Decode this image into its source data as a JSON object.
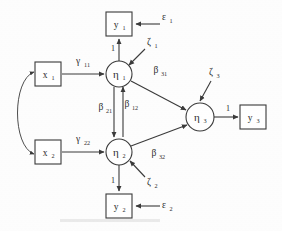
{
  "diagram": {
    "type": "path-diagram",
    "colors": {
      "stroke": "#3a3a3a",
      "text": "#2b2b2b",
      "background": "#fdfdfd"
    },
    "observed_variables": [
      {
        "id": "y1",
        "base": "y",
        "sub": "1",
        "shape": "square",
        "x": 119,
        "y": 24,
        "w": 26,
        "h": 24
      },
      {
        "id": "y2",
        "base": "y",
        "sub": "2",
        "shape": "square",
        "x": 119,
        "y": 206,
        "w": 26,
        "h": 24
      },
      {
        "id": "y3",
        "base": "y",
        "sub": "3",
        "shape": "square",
        "x": 253,
        "y": 117,
        "w": 26,
        "h": 24
      },
      {
        "id": "x1",
        "base": "x",
        "sub": "1",
        "shape": "square",
        "x": 48,
        "y": 74,
        "w": 26,
        "h": 24
      },
      {
        "id": "x2",
        "base": "x",
        "sub": "2",
        "shape": "square",
        "x": 48,
        "y": 152,
        "w": 26,
        "h": 24
      }
    ],
    "latent_variables": [
      {
        "id": "eta1",
        "base": "η",
        "sub": "1",
        "shape": "circle",
        "x": 119,
        "y": 74,
        "r": 13
      },
      {
        "id": "eta2",
        "base": "η",
        "sub": "2",
        "shape": "circle",
        "x": 119,
        "y": 152,
        "r": 13
      },
      {
        "id": "eta3",
        "base": "η",
        "sub": "3",
        "shape": "circle",
        "x": 200,
        "y": 117,
        "r": 14
      }
    ],
    "disturbances": [
      {
        "id": "zeta1",
        "base": "ζ",
        "sub": "1",
        "x": 152,
        "y": 43,
        "target": "eta1"
      },
      {
        "id": "zeta2",
        "base": "ζ",
        "sub": "2",
        "x": 152,
        "y": 183,
        "target": "eta2"
      },
      {
        "id": "zeta3",
        "base": "ζ",
        "sub": "3",
        "x": 214,
        "y": 73,
        "target": "eta3"
      }
    ],
    "errors": [
      {
        "id": "eps1",
        "base": "ε",
        "sub": "1",
        "x": 166,
        "y": 18,
        "target": "y1"
      },
      {
        "id": "eps2",
        "base": "ε",
        "sub": "2",
        "x": 166,
        "y": 206,
        "target": "y2"
      }
    ],
    "path_labels": [
      {
        "id": "gamma11",
        "base": "γ",
        "sub": "11",
        "x": 81,
        "y": 62,
        "from": "x1",
        "to": "eta1"
      },
      {
        "id": "gamma22",
        "base": "γ",
        "sub": "22",
        "x": 81,
        "y": 140,
        "from": "x2",
        "to": "eta2"
      },
      {
        "id": "beta21",
        "base": "β",
        "sub": "21",
        "x": 106,
        "y": 110,
        "from": "eta1",
        "to": "eta2"
      },
      {
        "id": "beta12",
        "base": "β",
        "sub": "12",
        "x": 130,
        "y": 107,
        "from": "eta2",
        "to": "eta1"
      },
      {
        "id": "beta31",
        "base": "β",
        "sub": "31",
        "x": 159,
        "y": 72,
        "from": "eta1",
        "to": "eta3"
      },
      {
        "id": "beta32",
        "base": "β",
        "sub": "32",
        "x": 157,
        "y": 155,
        "from": "eta2",
        "to": "eta3"
      }
    ],
    "fixed_loadings": [
      {
        "id": "load-eta1-y1",
        "text": "1",
        "x": 113,
        "y": 48,
        "from": "eta1",
        "to": "y1"
      },
      {
        "id": "load-eta2-y2",
        "text": "1",
        "x": 113,
        "y": 182,
        "from": "eta2",
        "to": "y2"
      },
      {
        "id": "load-eta3-y3",
        "text": "1",
        "x": 228,
        "y": 109,
        "from": "eta3",
        "to": "y3"
      }
    ],
    "covariance": {
      "id": "cov-x1-x2",
      "from": "x1",
      "to": "x2",
      "style": "double-headed-curved"
    }
  }
}
